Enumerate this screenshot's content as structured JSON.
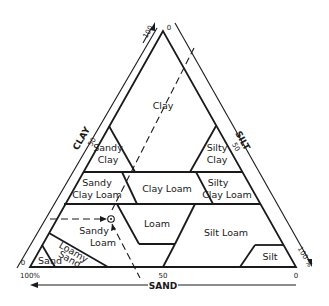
{
  "diagram": {
    "type": "soil-texture-triangle",
    "axes": {
      "clay": {
        "label": "CLAY",
        "ticks": [
          "100",
          "50",
          "0"
        ]
      },
      "silt": {
        "label": "SILT",
        "ticks": [
          "0",
          "50",
          "100 %"
        ]
      },
      "sand": {
        "label": "SAND",
        "ticks": [
          "100%",
          "50",
          "0"
        ]
      }
    },
    "regions": [
      {
        "id": "clay",
        "lines": [
          "Clay"
        ]
      },
      {
        "id": "sandy-clay",
        "lines": [
          "Sandy",
          "Clay"
        ]
      },
      {
        "id": "silty-clay",
        "lines": [
          "Silty",
          "Clay"
        ]
      },
      {
        "id": "sandy-clay-loam",
        "lines": [
          "Sandy",
          "Clay Loam"
        ]
      },
      {
        "id": "clay-loam",
        "lines": [
          "Clay Loam"
        ]
      },
      {
        "id": "silty-clay-loam",
        "lines": [
          "Silty",
          "Clay Loam"
        ]
      },
      {
        "id": "loam",
        "lines": [
          "Loam"
        ]
      },
      {
        "id": "sandy-loam",
        "lines": [
          "Sandy",
          "Loam"
        ]
      },
      {
        "id": "silt-loam",
        "lines": [
          "Silt Loam"
        ]
      },
      {
        "id": "loamy-sand",
        "lines": [
          "Loamy",
          "Sand"
        ]
      },
      {
        "id": "sand",
        "lines": [
          "Sand"
        ]
      },
      {
        "id": "silt",
        "lines": [
          "Silt"
        ]
      }
    ],
    "example_point": {
      "marker": "circled-dot",
      "region": "sandy-loam"
    }
  }
}
